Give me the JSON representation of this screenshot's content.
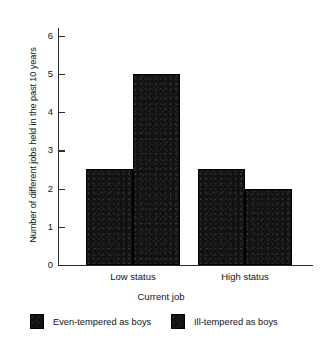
{
  "chart_data": {
    "type": "bar",
    "title": "",
    "xlabel": "Current job",
    "ylabel": "Number of different jobs held in the past 10 years",
    "categories": [
      "Low status",
      "High status"
    ],
    "series": [
      {
        "name": "Even-tempered as boys",
        "values": [
          2.5,
          2.5
        ],
        "color": "#121212"
      },
      {
        "name": "Ill-tempered as boys",
        "values": [
          5.0,
          2.0
        ],
        "color": "#121212"
      }
    ],
    "ylim": [
      0,
      6.2
    ],
    "yticks": [
      0,
      1,
      2,
      3,
      4,
      5,
      6
    ],
    "ytick_labels": [
      "0",
      "1",
      "2",
      "3",
      "4",
      "5",
      "6"
    ],
    "grid": false,
    "legend_position": "below"
  },
  "legend": {
    "items": [
      {
        "label": "Even-tempered as boys",
        "swatch": "legend-swatch-even-tempered"
      },
      {
        "label": "Ill-tempered as boys",
        "swatch": "legend-swatch-ill-tempered"
      }
    ]
  },
  "axes": {
    "y_label": "Number of different jobs held in the past 10 years",
    "x_label": "Current job",
    "y_ticks": [
      "0",
      "1",
      "2",
      "3",
      "4",
      "5",
      "6"
    ],
    "x_ticks": [
      "Low status",
      "High status"
    ]
  }
}
